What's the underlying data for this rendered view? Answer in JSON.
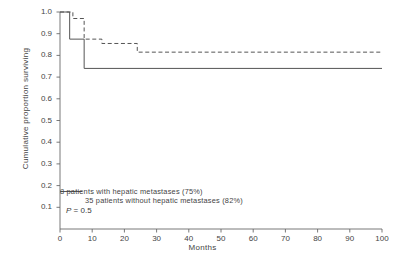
{
  "chart_data": {
    "type": "line",
    "subtype": "kaplan-meier-step",
    "title": "",
    "xlabel": "Months",
    "ylabel": "Cumulative proportion surviving",
    "xlim": [
      0,
      100
    ],
    "ylim": [
      0,
      1.0
    ],
    "xticks": [
      0,
      10,
      20,
      30,
      40,
      50,
      60,
      70,
      80,
      90,
      100
    ],
    "xtick_labels": [
      "0",
      "10",
      "20",
      "30",
      "40",
      "50",
      "60",
      "70",
      "80",
      "90",
      "100"
    ],
    "yticks": [
      0.1,
      0.2,
      0.3,
      0.4,
      0.5,
      0.6,
      0.7,
      0.8,
      0.9,
      1.0
    ],
    "ytick_labels": [
      "0.1",
      "0.2",
      "0.3",
      "0.4",
      "0.5",
      "0.6",
      "0.7",
      "0.8",
      "0.9",
      "1.0"
    ],
    "grid": false,
    "legend_position": "lower-left-inside",
    "annotations": [
      {
        "name": "p-value",
        "text_prefix": "P",
        "text_rest": " = 0.5"
      }
    ],
    "series": [
      {
        "name": "with-hepatic-metastases",
        "label": "8 patients with hepatic metastases (75%)",
        "n_patients": 8,
        "survival_percent": 75,
        "style": "solid",
        "color": "#555555",
        "x": [
          0,
          3,
          3,
          7.5,
          7.5,
          100
        ],
        "y": [
          1.0,
          1.0,
          0.875,
          0.875,
          0.74,
          0.74
        ]
      },
      {
        "name": "without-hepatic-metastases",
        "label": "35 patients without hepatic metastases (82%)",
        "n_patients": 35,
        "survival_percent": 82,
        "style": "dashed",
        "color": "#555555",
        "x": [
          0,
          4,
          4,
          7.5,
          7.5,
          13,
          13,
          24,
          24,
          100
        ],
        "y": [
          1.0,
          1.0,
          0.97,
          0.97,
          0.875,
          0.875,
          0.855,
          0.855,
          0.815,
          0.815
        ]
      }
    ]
  }
}
